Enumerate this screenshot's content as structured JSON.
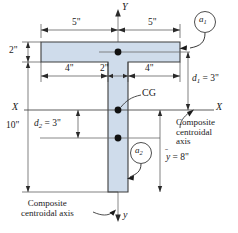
{
  "figure": {
    "shape": "tee",
    "fill_color": "#cfdceb",
    "stroke_color": "#3d3d3d",
    "line_color": "#4a4a4a",
    "text_color": "#1a1a1a"
  },
  "axes": {
    "y_top_label": "Y",
    "y_bottom_label": "y",
    "x_left_label": "X",
    "x_right_label": "X"
  },
  "dimensions": {
    "flange_left": "5\"",
    "flange_right": "5\"",
    "flange_thickness": "2\"",
    "inner_left": "4\"",
    "web_width": "2\"",
    "inner_right": "4\"",
    "total_height": "10\"",
    "d1": "d",
    "d1_sub": "1",
    "d1_value": "= 3\"",
    "d2": "d",
    "d2_sub": "2",
    "d2_value": "= 3\"",
    "ybar": "y",
    "ybar_value": "= 8\""
  },
  "callouts": {
    "area1": "a",
    "area1_sub": "1",
    "area2": "a",
    "area2_sub": "2",
    "cg": "CG",
    "composite_axis_right": [
      "Composite",
      "centroidal",
      "axis"
    ],
    "composite_axis_bottom": [
      "Composite",
      "centroidal axis"
    ]
  }
}
